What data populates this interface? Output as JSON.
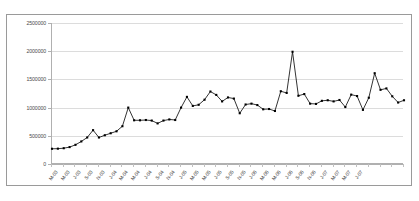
{
  "page": {
    "cut_text_top": "",
    "cut_text_bottom": ""
  },
  "chart_data": {
    "type": "line",
    "title": "",
    "subtitle": "",
    "xlabel": "",
    "ylabel": "",
    "ylim": [
      0,
      2500000
    ],
    "ytick_labels": [
      "0",
      "500000",
      "1000000",
      "1500000",
      "2000000",
      "2500000"
    ],
    "ytick_values": [
      0,
      500000,
      1000000,
      1500000,
      2000000,
      2500000
    ],
    "grid": true,
    "legend": false,
    "legend_position": "none",
    "marker": "filled-square",
    "line_color": "#000000",
    "marker_color": "#000000",
    "grid_color": "#dcdcdc",
    "axis_color": "#b0b0b0",
    "plot_background": "#ffffff",
    "x_tick_label_rotation": -52,
    "x_tick_label_interval": 2,
    "x": [
      "M-03",
      "A-03",
      "M-03",
      "J-03",
      "J-03",
      "A-03",
      "S-03",
      "O-03",
      "N-03",
      "D-03",
      "J-04",
      "F-04",
      "M-04",
      "A-04",
      "M-04",
      "J-04",
      "J-04",
      "A-04",
      "S-04",
      "O-04",
      "N-04",
      "D-04",
      "J-05",
      "F-05",
      "M-05",
      "A-05",
      "M-05",
      "J-05",
      "J-05",
      "A-05",
      "S-05",
      "O-05",
      "N-05",
      "D-05",
      "J-06",
      "F-06",
      "M-06",
      "A-06",
      "M-06",
      "J-06",
      "J-06",
      "A-06",
      "S-06",
      "O-06",
      "N-06",
      "D-06",
      "J-07",
      "F-07",
      "M-07",
      "A-07",
      "M-07",
      "J-07",
      "J-07"
    ],
    "xtick_labels": [
      "M-03",
      "M-03",
      "J-03",
      "S-03",
      "N-03",
      "J-04",
      "M-04",
      "M-04",
      "J-04",
      "S-04",
      "N-04",
      "J-05",
      "M-05",
      "M-05",
      "J-05",
      "S-05",
      "N-05",
      "J-06",
      "M-06",
      "M-06",
      "J-06",
      "S-06",
      "N-06",
      "J-07",
      "M-07",
      "M-07",
      "J-07"
    ],
    "values": [
      270000,
      272000,
      280000,
      300000,
      340000,
      400000,
      470000,
      600000,
      470000,
      510000,
      545000,
      580000,
      670000,
      1000000,
      775000,
      775000,
      780000,
      770000,
      720000,
      770000,
      790000,
      780000,
      1000000,
      1190000,
      1030000,
      1050000,
      1140000,
      1285000,
      1225000,
      1110000,
      1180000,
      1160000,
      900000,
      1055000,
      1070000,
      1045000,
      970000,
      975000,
      940000,
      1290000,
      1260000,
      1990000,
      1210000,
      1240000,
      1070000,
      1065000,
      1120000,
      1130000,
      1110000,
      1135000,
      1010000,
      1230000,
      1205000
    ],
    "series_tail": {
      "note": "",
      "x_extra": [
        "A-07",
        "M-07",
        "J-07",
        "J-07"
      ],
      "values_extra": [
        960000,
        1175000,
        1610000,
        1315000,
        1340000,
        1200000,
        1090000,
        1130000
      ]
    }
  }
}
